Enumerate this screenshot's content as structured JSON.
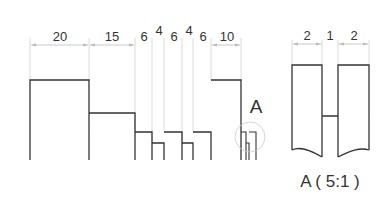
{
  "drawing": {
    "main_view": {
      "dimensions": [
        "20",
        "15",
        "6",
        "4",
        "6",
        "4",
        "6",
        "10"
      ],
      "detail_callout": "A"
    },
    "detail_view": {
      "dimensions": [
        "2",
        "1",
        "2"
      ],
      "label": "A ( 5:1 )"
    }
  },
  "colors": {
    "outline": "#333333",
    "dimension_line": "#bbbbbb",
    "extension_line": "#cccccc",
    "detail_circle": "#cccccc",
    "text": "#333333"
  }
}
